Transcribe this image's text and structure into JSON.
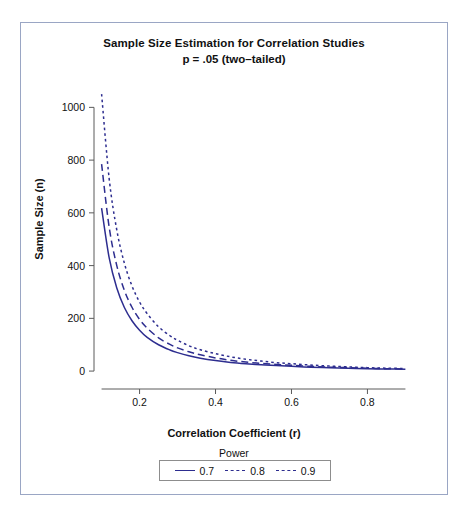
{
  "chart_data": {
    "type": "line",
    "title": "Sample Size Estimation for Correlation Studies",
    "subtitle": "p = .05 (two–tailed)",
    "xlabel": "Correlation Coefficient (r)",
    "ylabel": "Sample Size (n)",
    "xlim": [
      0.08,
      0.92
    ],
    "ylim": [
      -30,
      1100
    ],
    "xticks": [
      "0.2",
      "0.4",
      "0.6",
      "0.8"
    ],
    "xtick_values": [
      0.2,
      0.4,
      0.6,
      0.8
    ],
    "yticks": [
      "0",
      "200",
      "400",
      "600",
      "800",
      "1000"
    ],
    "ytick_values": [
      0,
      200,
      400,
      600,
      800,
      1000
    ],
    "grid": false,
    "legend_position": "below-axis",
    "legend_title": "Power",
    "line_color": "#2d2d8f",
    "x": [
      0.1,
      0.12,
      0.14,
      0.16,
      0.18,
      0.2,
      0.22,
      0.25,
      0.28,
      0.3,
      0.33,
      0.36,
      0.4,
      0.44,
      0.48,
      0.52,
      0.56,
      0.6,
      0.65,
      0.7,
      0.75,
      0.8,
      0.85,
      0.9
    ],
    "series": [
      {
        "name": "0.7",
        "label": "0.7",
        "dash": "solid",
        "values": [
          618,
          429,
          315,
          241,
          191,
          155,
          128,
          100,
          80,
          70,
          58,
          49,
          40,
          33,
          28,
          24,
          21,
          18,
          15,
          13,
          11,
          9,
          8,
          7
        ]
      },
      {
        "name": "0.8",
        "label": "0.8",
        "dash": "dashed",
        "values": [
          785,
          545,
          400,
          306,
          242,
          196,
          163,
          126,
          101,
          88,
          73,
          62,
          50,
          41,
          34,
          29,
          25,
          22,
          18,
          15,
          13,
          11,
          9,
          8
        ]
      },
      {
        "name": "0.9",
        "label": "0.9",
        "dash": "dotted",
        "values": [
          1050,
          729,
          535,
          409,
          323,
          262,
          218,
          168,
          134,
          117,
          96,
          81,
          66,
          54,
          45,
          38,
          32,
          28,
          23,
          19,
          16,
          13,
          11,
          10
        ]
      }
    ]
  }
}
